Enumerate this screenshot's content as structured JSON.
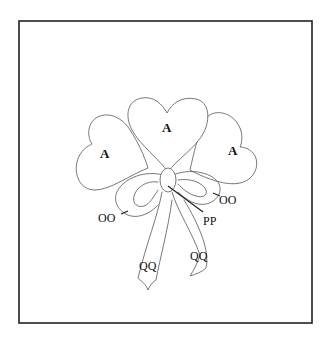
{
  "diagram": {
    "type": "quilt-applique-pattern",
    "frame": {
      "stroke": "#222222"
    },
    "hearts": [
      {
        "id": "left",
        "label": "A"
      },
      {
        "id": "center",
        "label": "A"
      },
      {
        "id": "right",
        "label": "A"
      }
    ],
    "bow": {
      "loops_label_left": "OO",
      "loops_label_right": "OO",
      "knot_label": "PP",
      "tails_label_left": "QQ",
      "tails_label_right": "QQ"
    },
    "colors": {
      "line": "#555555",
      "text": "#111111",
      "background": "#ffffff"
    }
  }
}
